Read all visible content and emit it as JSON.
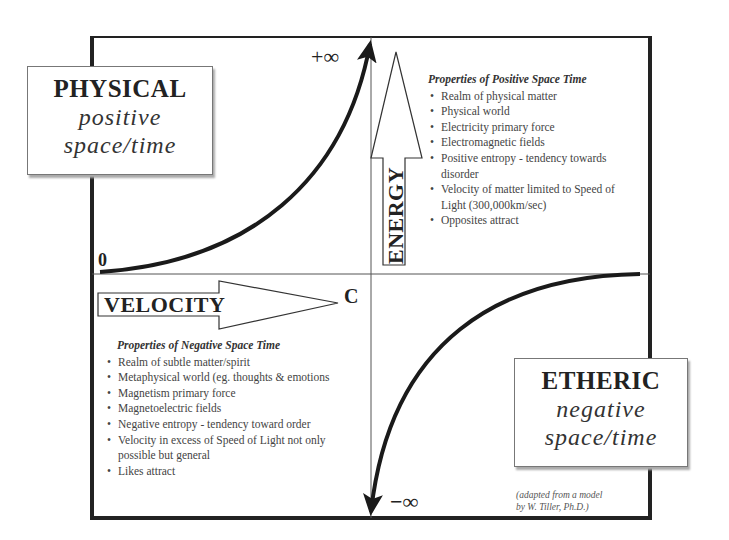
{
  "physical_box": {
    "title": "PHYSICAL",
    "line1": "positive",
    "line2": "space/time"
  },
  "etheric_box": {
    "title": "ETHERIC",
    "line1": "negative",
    "line2": "space/time"
  },
  "axes": {
    "vertical_label": "ENERGY",
    "horizontal_label": "VELOCITY",
    "top_mark": "+∞",
    "bottom_mark": "−∞",
    "origin_mark": "0",
    "speed_mark": "C"
  },
  "positive_properties": {
    "heading": "Properties of  Positive Space Time",
    "items": [
      "Realm of physical matter",
      "Physical world",
      "Electricity primary force",
      "Electromagnetic fields",
      "Positive entropy - tendency towards disorder",
      "Velocity of matter limited to Speed of Light (300,000km/sec)",
      "Opposites attract"
    ]
  },
  "negative_properties": {
    "heading": "Properties of  Negative Space Time",
    "items": [
      "Realm of subtle matter/spirit",
      "Metaphysical world (eg. thoughts & emotions",
      "Magnetism primary force",
      "Magnetoelectric  fields",
      "Negative entropy - tendency toward order",
      "Velocity in excess of Speed of Light not only possible but general",
      "Likes attract"
    ]
  },
  "credit": {
    "line1": "(adapted from a model",
    "line2": "by W. Tiller, Ph.D.)"
  },
  "colors": {
    "ink": "#1a1a1a",
    "text": "#444444",
    "background": "#ffffff"
  }
}
